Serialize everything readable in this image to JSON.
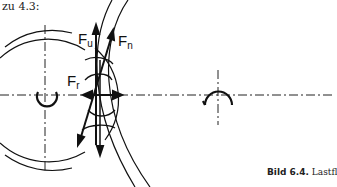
{
  "heading": "zu 4.3:",
  "labels": {
    "fu": "F",
    "fu_sub": "u",
    "fn": "F",
    "fn_sub": "n",
    "fr": "F",
    "fr_sub": "r"
  },
  "caption": {
    "number": "Bild 6.4.",
    "text": " Lastfl"
  },
  "colors": {
    "ink": "#111111",
    "background": "#ffffff"
  }
}
